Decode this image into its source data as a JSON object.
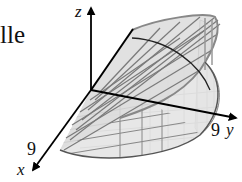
{
  "figure": {
    "side_text": "lle",
    "axes": {
      "x": {
        "label": "x",
        "tick": "9"
      },
      "y": {
        "label": "y",
        "tick": "9"
      },
      "z": {
        "label": "z"
      }
    },
    "colors": {
      "axis": "#000000",
      "surface_fill": "#e4e4e4",
      "mesh": "#7a7a7a",
      "outline": "#555555",
      "background": "#ffffff"
    }
  }
}
